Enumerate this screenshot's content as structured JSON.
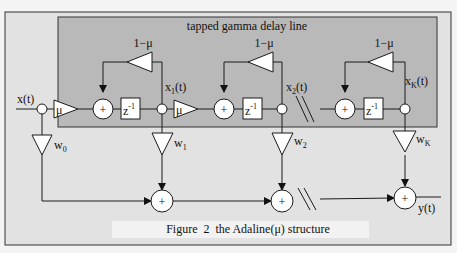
{
  "figure": {
    "caption": "Figure  2  the Adaline(μ) structure",
    "inner_box_title": "tapped gamma delay line"
  },
  "labels": {
    "input": "x(t)",
    "output": "y(t)",
    "mu": "μ",
    "one_minus_mu": "1−μ",
    "plus": "+",
    "delay": "z",
    "delay_exp": "-1",
    "x1": "x",
    "x1_sub": "1",
    "x2": "x",
    "x2_sub": "2",
    "xK": "x",
    "xK_sub": "K",
    "tap_suffix": "(t)",
    "w0": "w",
    "w0_sub": "0",
    "w1": "w",
    "w1_sub": "1",
    "w2": "w",
    "w2_sub": "2",
    "wK": "w",
    "wK_sub": "K"
  },
  "colors": {
    "outer_bg": "#e2e2e2",
    "inner_bg": "#b9b9b9",
    "line": "#1a1a1a",
    "shape_fill": "#ffffff",
    "caption_bg": "#f2f2f2"
  }
}
